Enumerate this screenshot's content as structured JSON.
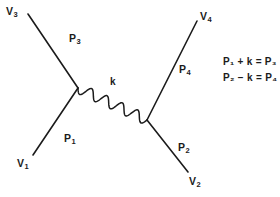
{
  "figure": {
    "kind": "feynman-diagram",
    "background_color": "#ffffff",
    "line_color": "#1b1b1b",
    "text_color": "#1b1b1b"
  },
  "vertices": {
    "left": {
      "label": "left-vertex",
      "x": 78,
      "y": 88
    },
    "right": {
      "label": "right-vertex",
      "x": 147,
      "y": 120
    }
  },
  "external_lines": [
    {
      "name": "v3-leg",
      "endpoint_label": "V",
      "endpoint_sub": "3",
      "momentum_label": "P",
      "momentum_sub": "3",
      "x1": 28,
      "y1": 14,
      "x2": 78,
      "y2": 88
    },
    {
      "name": "v1-leg",
      "endpoint_label": "V",
      "endpoint_sub": "1",
      "momentum_label": "P",
      "momentum_sub": "1",
      "x1": 33,
      "y1": 155,
      "x2": 78,
      "y2": 88
    },
    {
      "name": "v4-leg",
      "endpoint_label": "V",
      "endpoint_sub": "4",
      "momentum_label": "P",
      "momentum_sub": "4",
      "x1": 147,
      "y1": 120,
      "x2": 197,
      "y2": 21
    },
    {
      "name": "v2-leg",
      "endpoint_label": "V",
      "endpoint_sub": "2",
      "momentum_label": "P",
      "momentum_sub": "2",
      "x1": 147,
      "y1": 120,
      "x2": 188,
      "y2": 172
    }
  ],
  "propagator": {
    "name": "photon-propagator",
    "style": "wavy",
    "label": "k"
  },
  "labels": {
    "v3": {
      "text": "V",
      "sub": "3",
      "x": 6,
      "y": 6
    },
    "v1": {
      "text": "V",
      "sub": "1",
      "x": 17,
      "y": 158
    },
    "v4": {
      "text": "V",
      "sub": "4",
      "x": 200,
      "y": 11
    },
    "v2": {
      "text": "V",
      "sub": "2",
      "x": 189,
      "y": 176
    },
    "p3": {
      "text": "P",
      "sub": "3",
      "x": 69,
      "y": 33
    },
    "p1": {
      "text": "P",
      "sub": "1",
      "x": 64,
      "y": 133
    },
    "p4": {
      "text": "P",
      "sub": "4",
      "x": 179,
      "y": 64
    },
    "p2": {
      "text": "P",
      "sub": "2",
      "x": 178,
      "y": 142
    },
    "k": {
      "text": "k",
      "x": 110,
      "y": 77
    }
  },
  "equations": [
    {
      "name": "equation-1",
      "text": "P₁ + k = P₃",
      "x": 223,
      "y": 57
    },
    {
      "name": "equation-2",
      "text": "P₂ − k = P₄",
      "x": 223,
      "y": 73
    }
  ]
}
